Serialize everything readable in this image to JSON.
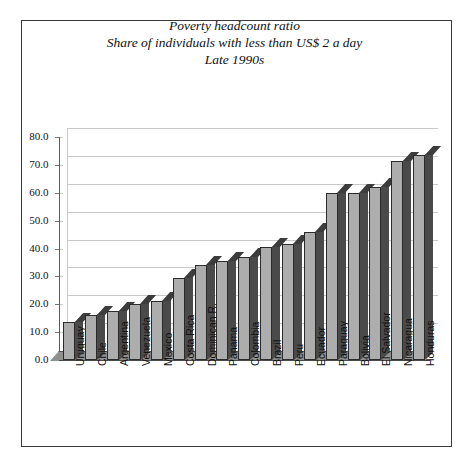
{
  "chart_data": {
    "type": "bar",
    "title": "Poverty headcount ratio",
    "title_lines": [
      "Poverty headcount ratio",
      "Share of individuals with less than US$ 2 a day",
      "Late 1990s"
    ],
    "subtitle": "Share of individuals with less than US$ 2 a day",
    "period": "Late 1990s",
    "xlabel": "",
    "ylabel": "",
    "ylim": [
      0,
      80
    ],
    "ytick_step": 10,
    "ytick_labels": [
      "0.0",
      "10.0",
      "20.0",
      "30.0",
      "40.0",
      "50.0",
      "60.0",
      "70.0",
      "80.0"
    ],
    "grid": true,
    "legend": "none",
    "style": "3d-column",
    "bar_color": "#adadad",
    "bar_side_color": "#4a4a4a",
    "bar_edge_color": "#2b2b2b",
    "grid_color": "#c9c9c9",
    "floor_color": "#8f8f8f",
    "categories": [
      "Uruguay",
      "Chile",
      "Argentina",
      "Venezuela",
      "Mexico",
      "Costa Rica",
      "Dominican R.",
      "Panama",
      "Colombia",
      "Brazil",
      "Peru",
      "Ecuador",
      "Paraguay",
      "Bolivia",
      "El Salvador",
      "Nicaragua",
      "Honduras"
    ],
    "values": [
      13.5,
      16.0,
      17.5,
      20.0,
      21.0,
      29.5,
      34.0,
      35.5,
      37.0,
      40.5,
      41.5,
      46.0,
      60.0,
      60.0,
      62.0,
      71.5,
      73.5
    ]
  }
}
